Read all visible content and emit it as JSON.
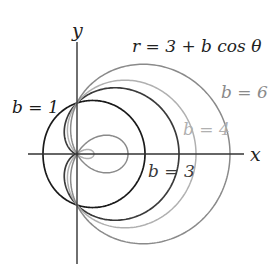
{
  "chart_data": {
    "type": "line",
    "subtype": "polar",
    "title": "r = 3 + b cos θ",
    "equation": {
      "lhs": "r",
      "constant": "3",
      "parameter": "b",
      "func": "cos",
      "variable": "θ"
    },
    "xlabel": "x",
    "ylabel": "y",
    "grid": false,
    "legend": "inline labels",
    "theta_range": [
      0,
      6.2832
    ],
    "series": [
      {
        "name": "b = 1",
        "b": 1,
        "color": "#1a1a1a",
        "label": {
          "text": "b = 1",
          "x": 12,
          "y": 113
        }
      },
      {
        "name": "b = 3",
        "b": 3,
        "color": "#3a3a3a",
        "label": {
          "text": "b = 3",
          "x": 148,
          "y": 177
        }
      },
      {
        "name": "b = 4",
        "b": 4,
        "color": "#b0b0b0",
        "label": {
          "text": "b = 4",
          "x": 183,
          "y": 135
        }
      },
      {
        "name": "b = 6",
        "b": 6,
        "color": "#8a8a8a",
        "label": {
          "text": "b = 6",
          "x": 221,
          "y": 98
        }
      }
    ],
    "axes": {
      "origin_px": [
        77,
        154
      ],
      "units_px": 17,
      "x_axis_px": [
        28,
        244
      ],
      "y_axis_px": [
        42,
        264
      ]
    }
  }
}
